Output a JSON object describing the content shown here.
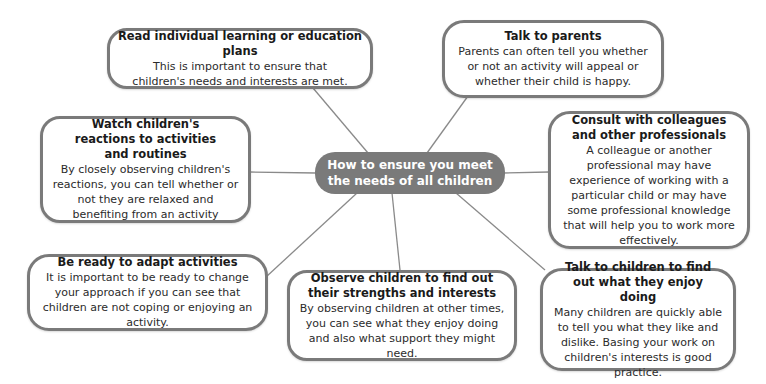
{
  "diagram": {
    "type": "mind-map",
    "center": {
      "label": "How to ensure you meet the needs of all children"
    },
    "colors": {
      "center_fill": "#7a7a7a",
      "border": "#7a7a7a",
      "connector": "#8a8a8a",
      "text": "#1e1e1e"
    },
    "nodes": [
      {
        "id": "read-plans",
        "title": "Read individual learning or education plans",
        "body": "This is important to ensure that children's needs and interests are met."
      },
      {
        "id": "talk-parents",
        "title": "Talk to parents",
        "body": "Parents can often tell you whether or not an activity will appeal or whether their child is happy."
      },
      {
        "id": "watch-reactions",
        "title": "Watch children's reactions to activities and routines",
        "body": "By closely observing children's reactions, you can tell whether or not they are relaxed and benefiting from an activity"
      },
      {
        "id": "consult-colleagues",
        "title": "Consult with colleagues and other professionals",
        "body": "A colleague or another professional may have experience of working with a particular child or may have some professional knowledge that will help you to work more effectively."
      },
      {
        "id": "adapt-activities",
        "title": "Be ready to adapt activities",
        "body": "It is important to be ready to change your approach if you can see that children are not coping or enjoying an activity."
      },
      {
        "id": "observe-children",
        "title": "Observe children to find out their strengths and interests",
        "body": "By observing children at other times, you can see what they enjoy doing and also what support they might need."
      },
      {
        "id": "talk-children",
        "title": "Talk to children to find out what they enjoy doing",
        "body": "Many children are quickly able to tell you what they like and dislike. Basing your work on children's interests is good practice."
      }
    ]
  }
}
